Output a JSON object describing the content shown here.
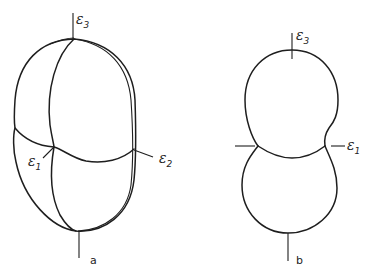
{
  "figure": {
    "panel_a": {
      "label": "a",
      "axes": [
        {
          "name": "ε",
          "subscript": "3",
          "position": "top"
        },
        {
          "name": "ε",
          "subscript": "1",
          "position": "left-junction"
        },
        {
          "name": "ε",
          "subscript": "2",
          "position": "right-junction"
        }
      ]
    },
    "panel_b": {
      "label": "b",
      "axes": [
        {
          "name": "ε",
          "subscript": "3",
          "position": "top"
        },
        {
          "name": "ε",
          "subscript": "1",
          "position": "right-junction"
        }
      ]
    },
    "colors": {
      "line": "#1e1e1e",
      "background": "#ffffff"
    }
  }
}
